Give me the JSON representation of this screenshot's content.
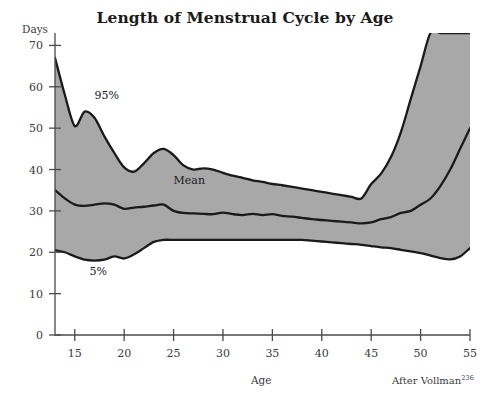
{
  "chart_data": {
    "type": "area",
    "title": "Length of Menstrual Cycle by Age",
    "xlabel": "Age",
    "ylabel": "Days",
    "source": "After Vollman",
    "source_ref": "236",
    "xlim": [
      13,
      55
    ],
    "ylim": [
      0,
      73
    ],
    "grid": false,
    "legend_position": "inline-annotations",
    "band_fill_color": "#a8a8a8",
    "line_color": "#1a1a1a",
    "axis_color": "#4a4a4a",
    "xticks": [
      15,
      20,
      25,
      30,
      35,
      40,
      45,
      50,
      55
    ],
    "yticks": [
      0,
      10,
      20,
      30,
      40,
      50,
      60,
      70
    ],
    "annotations": [
      {
        "label": "95%",
        "x": 17.0,
        "y": 57.0
      },
      {
        "label": "Mean",
        "x": 25.0,
        "y": 36.5
      },
      {
        "label": "5%",
        "x": 16.5,
        "y": 14.5
      }
    ],
    "x": [
      13,
      14,
      15,
      16,
      17,
      18,
      19,
      20,
      21,
      22,
      23,
      24,
      25,
      26,
      27,
      28,
      29,
      30,
      31,
      32,
      33,
      34,
      35,
      36,
      37,
      38,
      39,
      40,
      41,
      42,
      43,
      44,
      45,
      46,
      47,
      48,
      49,
      50,
      51,
      52,
      53,
      54,
      55
    ],
    "series": [
      {
        "name": "95%",
        "values": [
          67.0,
          58.0,
          50.5,
          54.0,
          52.5,
          48.0,
          44.0,
          40.5,
          39.5,
          41.5,
          44.0,
          45.0,
          43.5,
          41.0,
          40.0,
          40.3,
          40.0,
          39.2,
          38.5,
          38.0,
          37.4,
          37.0,
          36.5,
          36.2,
          35.8,
          35.4,
          35.0,
          34.6,
          34.2,
          33.8,
          33.4,
          33.0,
          36.5,
          39.0,
          43.0,
          49.0,
          57.0,
          65.0,
          73.0,
          73.0,
          73.0,
          73.0,
          73.0
        ]
      },
      {
        "name": "Mean",
        "values": [
          35.0,
          33.0,
          31.5,
          31.2,
          31.5,
          31.8,
          31.5,
          30.5,
          30.8,
          31.0,
          31.3,
          31.5,
          30.0,
          29.5,
          29.4,
          29.3,
          29.2,
          29.6,
          29.2,
          29.0,
          29.3,
          29.0,
          29.2,
          28.8,
          28.6,
          28.3,
          28.0,
          27.8,
          27.6,
          27.4,
          27.2,
          27.0,
          27.2,
          28.0,
          28.5,
          29.5,
          30.0,
          31.5,
          33.0,
          36.0,
          40.0,
          45.0,
          50.0
        ]
      },
      {
        "name": "5%",
        "values": [
          20.5,
          20.0,
          19.0,
          18.2,
          18.0,
          18.2,
          19.0,
          18.5,
          19.5,
          21.0,
          22.5,
          23.0,
          23.0,
          23.0,
          23.0,
          23.0,
          23.0,
          23.0,
          23.0,
          23.0,
          23.0,
          23.0,
          23.0,
          23.0,
          23.0,
          23.0,
          22.8,
          22.6,
          22.4,
          22.2,
          22.0,
          21.8,
          21.5,
          21.2,
          21.0,
          20.6,
          20.2,
          19.8,
          19.2,
          18.6,
          18.3,
          19.0,
          21.0
        ]
      }
    ]
  }
}
